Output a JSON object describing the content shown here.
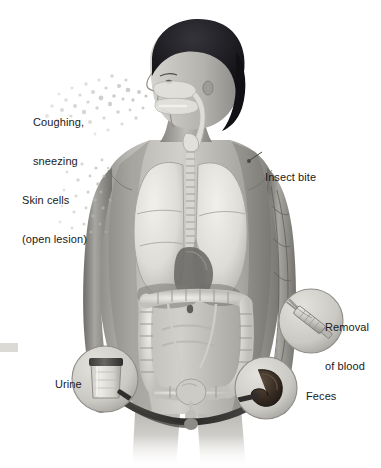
{
  "figure": {
    "type": "medical-illustration",
    "palette": {
      "background": "#ffffff",
      "skin_light": "#d8d6d2",
      "skin_mid": "#9d9b97",
      "skin_dark": "#5d5c59",
      "hair": "#16161a",
      "organ_light": "#e9e7e2",
      "organ_mid": "#b5b2ac",
      "organ_dark": "#6e6c68",
      "text": "#1a1a1a",
      "feces": "#3a2f27",
      "lid": "#4a4845"
    },
    "labels": [
      {
        "id": "coughing-sneezing",
        "line1": "Coughing,",
        "line2": "sneezing",
        "x": 33,
        "y": 90
      },
      {
        "id": "skin-cells",
        "line1": "Skin cells",
        "line2": "(open lesion)",
        "x": 22,
        "y": 168
      },
      {
        "id": "insect-bite",
        "line1": "Insect bite",
        "line2": "",
        "x": 265,
        "y": 145
      },
      {
        "id": "removal-of-blood",
        "line1": "Removal",
        "line2": "of blood",
        "x": 325,
        "y": 295
      },
      {
        "id": "feces",
        "line1": "Feces",
        "line2": "",
        "x": 306,
        "y": 364
      },
      {
        "id": "urine",
        "line1": "Urine",
        "line2": "",
        "x": 55,
        "y": 352
      }
    ],
    "callout_circles": [
      {
        "id": "urine-circle",
        "cx": 105,
        "cy": 379,
        "r": 33,
        "content": "urine specimen cup with dark screw lid"
      },
      {
        "id": "blood-circle",
        "cx": 311,
        "cy": 321,
        "r": 32,
        "content": "syringe drawing blood from arm"
      },
      {
        "id": "feces-circle",
        "cx": 266,
        "cy": 388,
        "r": 31,
        "content": "stool specimen"
      }
    ],
    "anatomy": [
      {
        "id": "head",
        "label": "head in left profile with dark hair"
      },
      {
        "id": "nasal-oral-cavity",
        "label": "nasal cavity, oral cavity, pharynx"
      },
      {
        "id": "trachea",
        "label": "trachea and spine"
      },
      {
        "id": "lungs",
        "label": "left and right lungs with lobes"
      },
      {
        "id": "heart",
        "label": "heart"
      },
      {
        "id": "liver",
        "label": "liver"
      },
      {
        "id": "large-intestine",
        "label": "large intestine / colon"
      },
      {
        "id": "kidneys-ureters",
        "label": "ureters"
      },
      {
        "id": "bladder",
        "label": "urinary bladder"
      },
      {
        "id": "arm-veins",
        "label": "veins of the right arm"
      }
    ],
    "particles": {
      "droplets": {
        "id": "respiratory-droplets",
        "origin": "mouth and nose",
        "count": 120
      },
      "skin_flakes": {
        "id": "skin-flake-particles",
        "origin": "left shoulder and arm",
        "count": 70
      }
    }
  }
}
